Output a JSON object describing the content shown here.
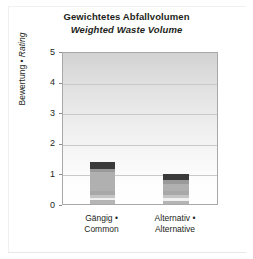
{
  "chart_data": {
    "type": "bar",
    "subtype": "stacked-bar",
    "title": "Gewichtetes Abfallvolumen",
    "subtitle": "Weighted Waste Volume",
    "xlabel": "",
    "ylabel": "Bewertung • Rating",
    "ylabel_parts": {
      "de": "Bewertung",
      "sep": " • ",
      "en": "Rating"
    },
    "ylim": [
      0,
      5
    ],
    "ytick_labels": [
      "0",
      "1",
      "2",
      "3",
      "4",
      "5"
    ],
    "ytick_values": [
      0,
      1,
      2,
      3,
      4,
      5
    ],
    "grid": true,
    "gridlines_at": [
      1,
      2,
      3,
      4
    ],
    "legend": "none",
    "categories": [
      "Gängig • Common",
      "Alternativ • Alternative"
    ],
    "category_labels": [
      {
        "de": "Gängig •",
        "en": "Common"
      },
      {
        "de": "Alternativ •",
        "en": "Alternative"
      }
    ],
    "totals": [
      1.37,
      0.98
    ],
    "series": [
      {
        "name": "segment-1",
        "color": "#b5b5b5",
        "values": [
          0.12,
          0.1
        ]
      },
      {
        "name": "segment-2",
        "color": "#f0f0f0",
        "values": [
          0.08,
          0.09
        ]
      },
      {
        "name": "segment-3",
        "color": "#c4c4c4",
        "values": [
          0.1,
          0.12
        ]
      },
      {
        "name": "segment-4",
        "color": "#a8a8a8",
        "values": [
          0.12,
          0.13
        ]
      },
      {
        "name": "segment-5",
        "color": "#b0b0b0",
        "values": [
          0.62,
          0.2
        ]
      },
      {
        "name": "segment-6",
        "color": "#9a9a9a",
        "values": [
          0.09,
          0.14
        ]
      },
      {
        "name": "segment-7",
        "color": "#3a3a3a",
        "values": [
          0.24,
          0.2
        ]
      }
    ],
    "bar_geometry": [
      {
        "left_px": 27,
        "width_px": 25
      },
      {
        "left_px": 100,
        "width_px": 26
      }
    ]
  },
  "colors": {
    "text": "#231f20",
    "plot_border": "#a8a8a8",
    "gridline": "#c9c9c9",
    "background": "#ffffff"
  }
}
